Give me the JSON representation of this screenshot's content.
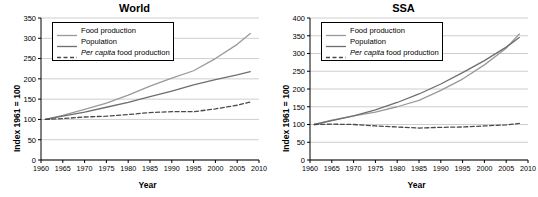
{
  "charts": [
    {
      "title": "World",
      "ylabel": "Index 1961 = 100",
      "xlabel": "Year",
      "legend": [
        {
          "label": "Food production",
          "key": "solid-light"
        },
        {
          "label": "Population",
          "key": "solid-dark"
        },
        {
          "label": "Per capita food production",
          "key": "dashed-dark",
          "italic_prefix": "Per capita",
          "rest": " food production"
        }
      ]
    },
    {
      "title": "SSA",
      "ylabel": "Index 1961 = 100",
      "xlabel": "Year",
      "legend": [
        {
          "label": "Food production",
          "key": "solid-light"
        },
        {
          "label": "Population",
          "key": "solid-dark"
        },
        {
          "label": "Per capita food production",
          "key": "dashed-dark",
          "italic_prefix": "Per capita",
          "rest": " food production"
        }
      ]
    }
  ],
  "chart_data": [
    {
      "type": "line",
      "title": "World",
      "xlabel": "Year",
      "ylabel": "Index 1961 = 100",
      "xlim": [
        1960,
        2010
      ],
      "ylim": [
        0,
        350
      ],
      "xticks": [
        1960,
        1965,
        1970,
        1975,
        1980,
        1985,
        1990,
        1995,
        2000,
        2005,
        2010
      ],
      "yticks": [
        0,
        50,
        100,
        150,
        200,
        250,
        300,
        350
      ],
      "grid": "horizontal",
      "legend_position": "upper-left",
      "x": [
        1961,
        1965,
        1970,
        1975,
        1980,
        1985,
        1990,
        1995,
        2000,
        2005,
        2008
      ],
      "series": [
        {
          "name": "Food production",
          "color": "#9a9a9a",
          "style": "solid",
          "values": [
            100,
            110,
            125,
            140,
            160,
            182,
            202,
            220,
            250,
            285,
            312
          ]
        },
        {
          "name": "Population",
          "color": "#6e6e6e",
          "style": "solid",
          "values": [
            100,
            108,
            118,
            130,
            142,
            156,
            170,
            185,
            198,
            210,
            218
          ]
        },
        {
          "name": "Per capita food production",
          "color": "#4a4a4a",
          "style": "dashed",
          "values": [
            100,
            102,
            106,
            108,
            112,
            117,
            119,
            119,
            126,
            135,
            143
          ]
        }
      ]
    },
    {
      "type": "line",
      "title": "SSA",
      "xlabel": "Year",
      "ylabel": "Index 1961 = 100",
      "xlim": [
        1960,
        2010
      ],
      "ylim": [
        0,
        400
      ],
      "xticks": [
        1960,
        1965,
        1970,
        1975,
        1980,
        1985,
        1990,
        1995,
        2000,
        2005,
        2010
      ],
      "yticks": [
        0,
        50,
        100,
        150,
        200,
        250,
        300,
        350,
        400
      ],
      "grid": "horizontal",
      "legend_position": "upper-left",
      "x": [
        1961,
        1965,
        1970,
        1975,
        1980,
        1985,
        1990,
        1995,
        2000,
        2005,
        2008
      ],
      "series": [
        {
          "name": "Food production",
          "color": "#9a9a9a",
          "style": "solid",
          "values": [
            100,
            112,
            124,
            135,
            150,
            168,
            196,
            228,
            268,
            315,
            355
          ]
        },
        {
          "name": "Population",
          "color": "#6e6e6e",
          "style": "solid",
          "values": [
            100,
            111,
            124,
            141,
            162,
            186,
            214,
            246,
            280,
            318,
            345
          ]
        },
        {
          "name": "Per capita food production",
          "color": "#4a4a4a",
          "style": "dashed",
          "values": [
            100,
            101,
            100,
            96,
            93,
            90,
            92,
            93,
            96,
            99,
            103
          ]
        }
      ]
    }
  ]
}
